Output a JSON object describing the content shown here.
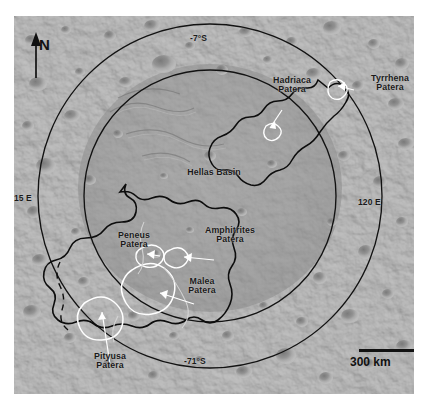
{
  "map": {
    "title": "Hellas Basin region, Mars",
    "basemap_style": "shaded-relief grayscale",
    "colors": {
      "background": "#ffffff",
      "terrain_base": "#8e8e8e",
      "ring_outline": "#111111",
      "unit_outline": "#0d0d0d",
      "patera_outline": "#ffffff",
      "label_text": "#1a1a1a"
    },
    "north_arrow": {
      "label": "N",
      "icon": "north-arrow-icon"
    },
    "scale_bar": {
      "label": "300 km",
      "length_px": 62
    },
    "graticule_labels": [
      {
        "id": "lat-top",
        "text": "-7°S",
        "x": 190,
        "y": 26
      },
      {
        "id": "lon-left",
        "text": "15 E",
        "x": 8,
        "y": 186
      },
      {
        "id": "lon-right",
        "text": "120 E",
        "x": 358,
        "y": 190
      },
      {
        "id": "lat-bottom",
        "text": "-71°S",
        "x": 185,
        "y": 349
      }
    ],
    "features": [
      {
        "id": "hellas-basin",
        "name": "Hellas Basin",
        "label_lines": [
          "Hellas Basin"
        ],
        "x": 200,
        "y": 178,
        "align": "center",
        "leader": false
      },
      {
        "id": "hadriaca-patera",
        "name": "Hadriaca Patera",
        "label_lines": [
          "Hadriaca",
          "Patera"
        ],
        "x": 281,
        "y": 86,
        "align": "center",
        "leader": true
      },
      {
        "id": "tyrrhena-patera",
        "name": "Tyrrhena Patera",
        "label_lines": [
          "Tyrrhena",
          "Patera"
        ],
        "x": 377,
        "y": 84,
        "align": "center",
        "leader": true
      },
      {
        "id": "amphitrites-patera",
        "name": "Amphitrites Patera",
        "label_lines": [
          "Amphitrites",
          "Patera"
        ],
        "x": 220,
        "y": 236,
        "align": "center",
        "leader": true
      },
      {
        "id": "peneus-patera",
        "name": "Peneus Patera",
        "label_lines": [
          "Peneus",
          "Patera"
        ],
        "x": 126,
        "y": 241,
        "align": "center",
        "leader": true
      },
      {
        "id": "malea-patera",
        "name": "Malea Patera",
        "label_lines": [
          "Malea",
          "Patera"
        ],
        "x": 192,
        "y": 287,
        "align": "center",
        "leader": true
      },
      {
        "id": "pityusa-patera",
        "name": "Pityusa Patera",
        "label_lines": [
          "Pityusa",
          "Patera"
        ],
        "x": 101,
        "y": 361,
        "align": "center",
        "leader": true
      }
    ]
  }
}
